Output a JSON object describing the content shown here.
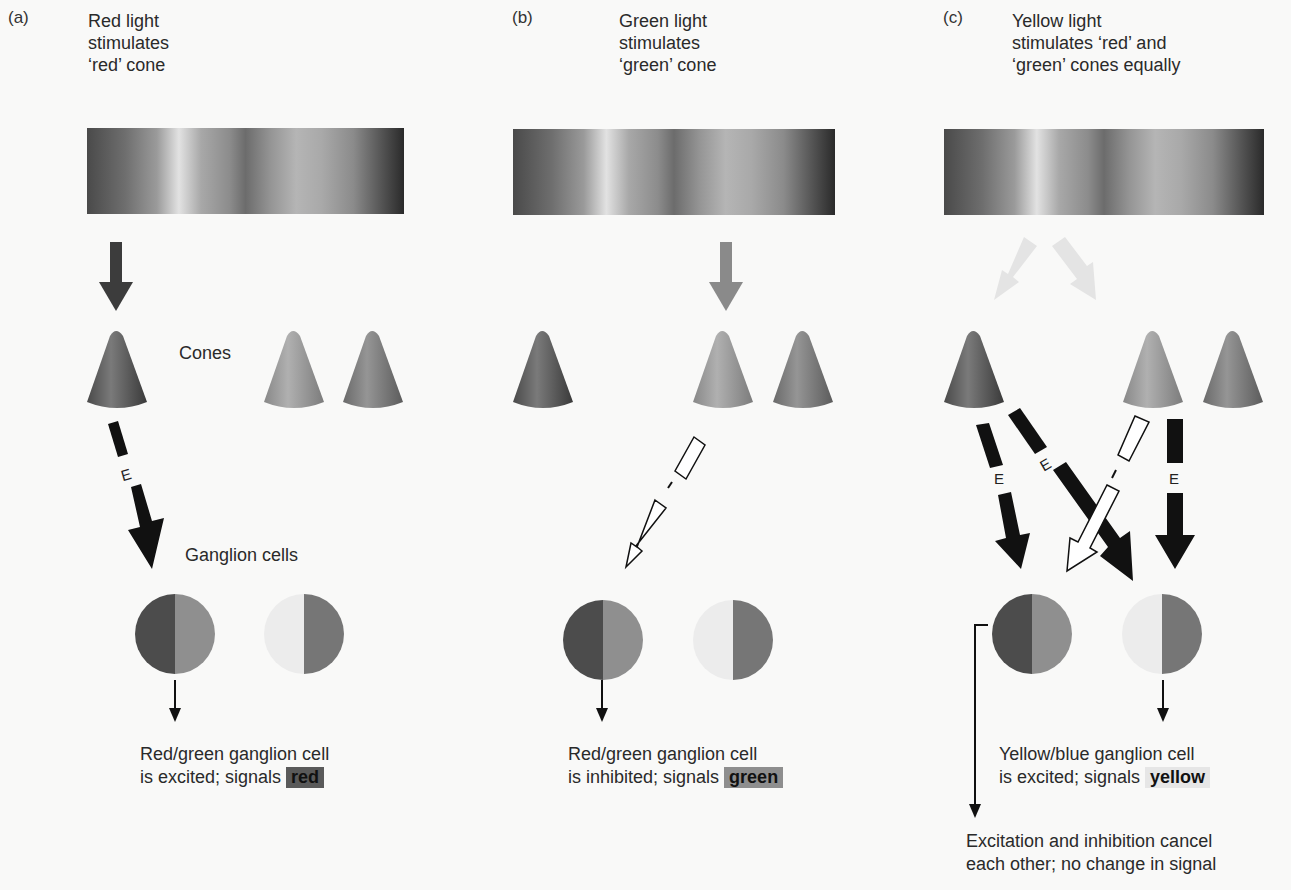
{
  "figure": {
    "colors": {
      "red_cone": "#5e5e5e",
      "green_cone": "#9a9a9a",
      "blue_cone": "#7d7d7d",
      "ganglion_red_half": "#4c4c4c",
      "ganglion_green_half": "#8f8f8f",
      "ganglion_yellow_half": "#ececec",
      "ganglion_blue_half": "#767676",
      "excitatory_arrow": "#111111",
      "inhibitory_arrow": "#ffffff"
    },
    "labels": {
      "cones": "Cones",
      "ganglion_cells": "Ganglion cells",
      "excitation_mark": "E",
      "inhibition_mark": "I"
    },
    "panels": [
      {
        "letter": "(a)",
        "caption": [
          "Red light",
          "stimulates",
          "‘red’ cone"
        ],
        "stimulated_cones": [
          "red"
        ],
        "connections": [
          {
            "from": "red cone",
            "to": "red/green ganglion cell",
            "type": "E"
          }
        ],
        "result": [
          "Red/green ganglion cell",
          "is excited; signals"
        ],
        "signal": "red"
      },
      {
        "letter": "(b)",
        "caption": [
          "Green light",
          "stimulates",
          "‘green’ cone"
        ],
        "stimulated_cones": [
          "green"
        ],
        "connections": [
          {
            "from": "green cone",
            "to": "red/green ganglion cell",
            "type": "I"
          }
        ],
        "result": [
          "Red/green ganglion cell",
          "is inhibited; signals"
        ],
        "signal": "green"
      },
      {
        "letter": "(c)",
        "caption": [
          "Yellow light",
          "stimulates ‘red’ and",
          "‘green’ cones equally"
        ],
        "stimulated_cones": [
          "red",
          "green"
        ],
        "connections": [
          {
            "from": "red cone",
            "to": "red/green ganglion cell",
            "type": "E"
          },
          {
            "from": "red cone",
            "to": "yellow/blue ganglion cell",
            "type": "E"
          },
          {
            "from": "green cone",
            "to": "red/green ganglion cell",
            "type": "I"
          },
          {
            "from": "green cone",
            "to": "yellow/blue ganglion cell",
            "type": "E"
          }
        ],
        "result": [
          "Yellow/blue ganglion cell",
          "is excited; signals"
        ],
        "signal": "yellow",
        "note": [
          "Excitation and inhibition cancel",
          "each other; no change in signal"
        ]
      }
    ]
  }
}
